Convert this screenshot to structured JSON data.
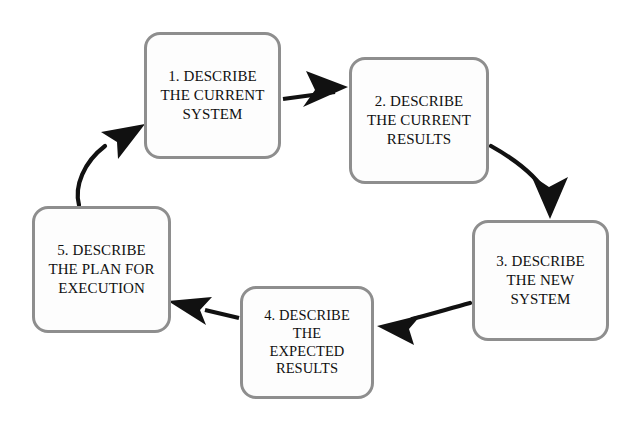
{
  "diagram": {
    "background_color": "#ffffff",
    "node_border_color": "#8e8e8e",
    "node_fill_color": "#fdfdfd",
    "arrow_color": "#111111",
    "text_color": "#101010",
    "nodes": [
      {
        "id": "1",
        "name": "describe-current-system",
        "label": "1. DESCRIBE\nTHE CURRENT\nSYSTEM"
      },
      {
        "id": "2",
        "name": "describe-current-results",
        "label": "2. DESCRIBE\nTHE CURRENT\nRESULTS"
      },
      {
        "id": "3",
        "name": "describe-new-system",
        "label": "3. DESCRIBE\nTHE NEW\nSYSTEM"
      },
      {
        "id": "4",
        "name": "describe-expected-results",
        "label": "4. DESCRIBE\nTHE\nEXPECTED\nRESULTS"
      },
      {
        "id": "5",
        "name": "describe-plan-for-execution",
        "label": "5.  DESCRIBE\nTHE PLAN FOR\nEXECUTION"
      }
    ],
    "connectors": [
      {
        "name": "arrow-1-to-2",
        "from": "1",
        "to": "2",
        "style": "straight",
        "direction": "right"
      },
      {
        "name": "arrow-2-to-3",
        "from": "2",
        "to": "3",
        "style": "curved",
        "direction": "down"
      },
      {
        "name": "arrow-3-to-4",
        "from": "3",
        "to": "4",
        "style": "curved",
        "direction": "left"
      },
      {
        "name": "arrow-4-to-5",
        "from": "4",
        "to": "5",
        "style": "straight",
        "direction": "left"
      },
      {
        "name": "arrow-5-to-1",
        "from": "5",
        "to": "1",
        "style": "curved",
        "direction": "up-right"
      }
    ]
  }
}
